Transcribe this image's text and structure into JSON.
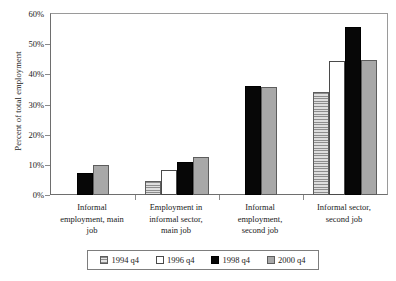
{
  "chart_data": {
    "type": "bar",
    "title": "",
    "subtitle": "",
    "xlabel": "",
    "ylabel": "Percent of total employment",
    "ylim": [
      0,
      60
    ],
    "ytick_labels": [
      "0%",
      "10%",
      "20%",
      "30%",
      "40%",
      "50%",
      "60%"
    ],
    "ytick_values": [
      0,
      10,
      20,
      30,
      40,
      50,
      60
    ],
    "grid": false,
    "legend_position": "bottom",
    "categories": [
      "Informal employment, main job",
      "Employment in informal sector, main job",
      "Informal employment, second job",
      "Informal sector, second job"
    ],
    "series": [
      {
        "name": "1994 q4",
        "color": "#c2c2c2",
        "pattern": "horizontal-lines",
        "values": [
          null,
          4.8,
          null,
          34.0
        ]
      },
      {
        "name": "1996 q4",
        "color": "#ffffff",
        "pattern": "solid",
        "values": [
          null,
          8.4,
          null,
          44.3
        ]
      },
      {
        "name": "1998 q4",
        "color": "#070707",
        "pattern": "solid",
        "values": [
          7.2,
          11.0,
          36.2,
          55.6
        ]
      },
      {
        "name": "2000 q4",
        "color": "#a8a8a8",
        "pattern": "solid",
        "values": [
          10.0,
          12.7,
          35.7,
          44.6
        ]
      }
    ]
  },
  "axis": {
    "y_title": "Percent of total employment",
    "ticks": [
      "60%",
      "50%",
      "40%",
      "30%",
      "20%",
      "10%",
      "0%"
    ]
  },
  "category_labels": [
    "Informal\nemployment, main\njob",
    "Employment in\ninformal sector,\nmain job",
    "Informal\nemployment,\nsecond job",
    "Informal sector,\nsecond job"
  ],
  "category_lines": [
    [
      "Informal",
      "employment, main",
      "job"
    ],
    [
      "Employment in",
      "informal sector,",
      "main job"
    ],
    [
      "Informal",
      "employment,",
      "second job"
    ],
    [
      "Informal sector,",
      "second job"
    ]
  ],
  "legend": {
    "items": [
      {
        "label": "1994 q4",
        "swatch": "swatch-1994"
      },
      {
        "label": "1996 q4",
        "swatch": "swatch-1996"
      },
      {
        "label": "1998 q4",
        "swatch": "swatch-1998"
      },
      {
        "label": "2000 q4",
        "swatch": "swatch-2000"
      }
    ]
  }
}
